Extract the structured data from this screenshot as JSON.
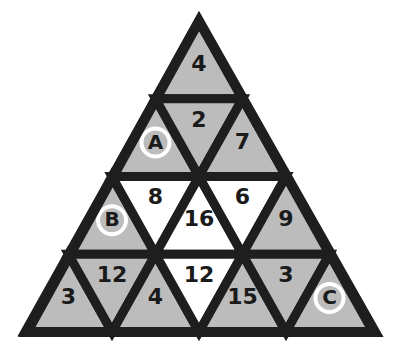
{
  "puzzle": {
    "title": "Triangle number puzzle",
    "colors": {
      "outline": "#1e1e1e",
      "shaded": "#bcbcbc",
      "blank": "#ffffff",
      "marker_ring": "#ffffff"
    },
    "rows": [
      {
        "cells": [
          {
            "orientation": "up",
            "label": "4",
            "shade": "shaded",
            "marker": false
          }
        ]
      },
      {
        "cells": [
          {
            "orientation": "up",
            "label": "A",
            "shade": "shaded",
            "marker": true
          },
          {
            "orientation": "down",
            "label": "2",
            "shade": "shaded",
            "marker": false
          },
          {
            "orientation": "up",
            "label": "7",
            "shade": "shaded",
            "marker": false
          }
        ]
      },
      {
        "cells": [
          {
            "orientation": "up",
            "label": "B",
            "shade": "shaded",
            "marker": true
          },
          {
            "orientation": "down",
            "label": "8",
            "shade": "blank",
            "marker": false
          },
          {
            "orientation": "up",
            "label": "16",
            "shade": "blank",
            "marker": false
          },
          {
            "orientation": "down",
            "label": "6",
            "shade": "blank",
            "marker": false
          },
          {
            "orientation": "up",
            "label": "9",
            "shade": "shaded",
            "marker": false
          }
        ]
      },
      {
        "cells": [
          {
            "orientation": "up",
            "label": "3",
            "shade": "shaded",
            "marker": false
          },
          {
            "orientation": "down",
            "label": "12",
            "shade": "shaded",
            "marker": false
          },
          {
            "orientation": "up",
            "label": "4",
            "shade": "shaded",
            "marker": false
          },
          {
            "orientation": "down",
            "label": "12",
            "shade": "blank",
            "marker": false
          },
          {
            "orientation": "up",
            "label": "15",
            "shade": "shaded",
            "marker": false
          },
          {
            "orientation": "down",
            "label": "3",
            "shade": "shaded",
            "marker": false
          },
          {
            "orientation": "up",
            "label": "C",
            "shade": "shaded",
            "marker": true
          }
        ]
      }
    ]
  }
}
